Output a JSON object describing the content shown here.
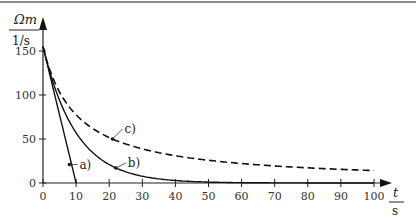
{
  "chart_data": {
    "type": "line",
    "title": "",
    "xlabel": "t / s",
    "ylabel": "Ωm / 1/s",
    "ylabel_num": "Ωm",
    "ylabel_den": "1/s",
    "xlabel_num": "t",
    "xlabel_den": "s",
    "xlim": [
      0,
      100
    ],
    "ylim": [
      0,
      150
    ],
    "xticks": [
      0,
      10,
      20,
      30,
      40,
      50,
      60,
      70,
      80,
      90,
      100
    ],
    "yticks": [
      0,
      50,
      100,
      150
    ],
    "grid": false,
    "legend": "inline labels",
    "series": [
      {
        "name": "a)",
        "style": "solid",
        "x": [
          0,
          10
        ],
        "values": [
          155,
          0
        ]
      },
      {
        "name": "b)",
        "style": "solid",
        "x": [
          0,
          5,
          10,
          15,
          20,
          25,
          30,
          40,
          50,
          60,
          70,
          80,
          90,
          100
        ],
        "values": [
          155,
          94,
          57,
          35,
          21,
          13,
          8,
          3,
          1,
          0.4,
          0,
          0,
          0,
          0
        ]
      },
      {
        "name": "c)",
        "style": "dashed",
        "x": [
          0,
          5,
          10,
          15,
          20,
          30,
          40,
          50,
          60,
          70,
          80,
          90,
          100
        ],
        "values": [
          155,
          103,
          78,
          62,
          52,
          39,
          31,
          26,
          22,
          19,
          17,
          16,
          14
        ]
      }
    ],
    "annotations": [
      {
        "text": "a)",
        "x": 8,
        "y": 21
      },
      {
        "text": "b)",
        "x": 22,
        "y": 17
      },
      {
        "text": "c)",
        "x": 21,
        "y": 50
      }
    ]
  }
}
